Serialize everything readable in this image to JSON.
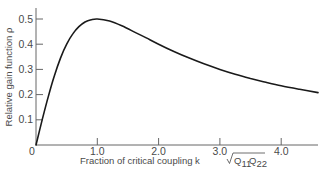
{
  "chart_data": {
    "type": "line",
    "title": "",
    "xlabel": "Fraction of critical coupling k√Q11Q22",
    "xlabel_parts": {
      "main": "Fraction of critical coupling k",
      "sqrt_a": "Q",
      "sub_a": "11",
      "sqrt_b": "Q",
      "sub_b": "22"
    },
    "ylabel": "Relative gain function ρ",
    "xlim": [
      0,
      4.6
    ],
    "ylim": [
      0,
      0.55
    ],
    "x_ticks": [
      0,
      1.0,
      2.0,
      3.0,
      4.0
    ],
    "x_tick_labels": [
      "0",
      "1.0",
      "2.0",
      "3.0",
      "4.0"
    ],
    "y_ticks": [
      0.1,
      0.2,
      0.3,
      0.4,
      0.5
    ],
    "y_tick_labels": [
      "0.1",
      "0.2",
      "0.3",
      "0.4",
      "0.5"
    ],
    "grid": false,
    "legend": null,
    "series": [
      {
        "name": "rho",
        "color": "#1a1a1a",
        "x": [
          0,
          0.1,
          0.2,
          0.3,
          0.4,
          0.5,
          0.6,
          0.7,
          0.8,
          0.9,
          1.0,
          1.2,
          1.4,
          1.6,
          1.8,
          2.0,
          2.25,
          2.5,
          2.75,
          3.0,
          3.25,
          3.5,
          3.75,
          4.0,
          4.3,
          4.6
        ],
        "values": [
          0,
          0.099,
          0.192,
          0.275,
          0.345,
          0.4,
          0.441,
          0.47,
          0.488,
          0.497,
          0.5,
          0.492,
          0.473,
          0.449,
          0.425,
          0.4,
          0.371,
          0.345,
          0.321,
          0.3,
          0.281,
          0.264,
          0.249,
          0.235,
          0.221,
          0.208
        ]
      }
    ]
  }
}
